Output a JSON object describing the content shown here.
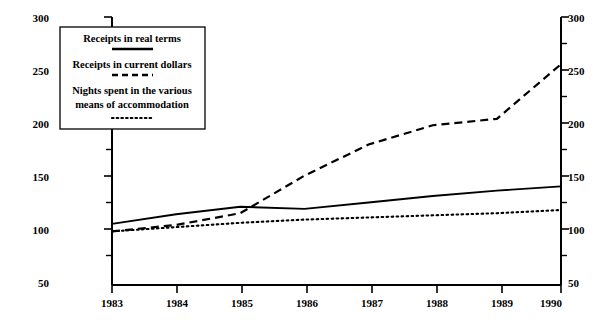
{
  "chart_data": {
    "type": "line",
    "title": "",
    "subtitle": "",
    "xlabel": "",
    "ylabel": "",
    "x": [
      1983,
      1984,
      1985,
      1986,
      1987,
      1988,
      1989,
      1990
    ],
    "xtick_labels": [
      "1983",
      "1984",
      "1985",
      "1986",
      "1987",
      "1988",
      "1989",
      "1990"
    ],
    "ytick_labels": [
      "50",
      "100",
      "150",
      "200",
      "250",
      "300"
    ],
    "ytick_values": [
      50,
      100,
      150,
      200,
      250,
      300
    ],
    "yminor_values": [
      75,
      125,
      175,
      225,
      275
    ],
    "ylim": [
      50,
      300
    ],
    "xlim": [
      1983,
      1990
    ],
    "grid": false,
    "legend_position": "top-left",
    "right_axis_mirrors_left": true,
    "series": [
      {
        "name": "Receipts in real terms",
        "style": "solid",
        "values": [
          107,
          116,
          123,
          121,
          127,
          133,
          138,
          142
        ]
      },
      {
        "name": "Receipts in current dollars",
        "style": "dashed",
        "values": [
          100,
          106,
          117,
          152,
          181,
          199,
          205,
          256
        ]
      },
      {
        "name": "Nights spent in the various means of accommodation",
        "style": "dotted",
        "values": [
          100,
          104,
          108,
          111,
          113,
          115,
          117,
          120
        ]
      }
    ]
  },
  "legend": {
    "entries": [
      {
        "label": "Receipts in real terms",
        "label_line2": "",
        "style": "solid"
      },
      {
        "label": "Receipts in current dollars",
        "label_line2": "",
        "style": "dashed"
      },
      {
        "label": "Nights spent in the various",
        "label_line2": "means of accommodation",
        "style": "dotted"
      }
    ]
  },
  "axes": {
    "left_ticks": [
      "300",
      "250",
      "200",
      "150",
      "100",
      "50"
    ],
    "right_ticks": [
      "300",
      "250",
      "200",
      "150",
      "100",
      "50"
    ],
    "bottom_ticks": [
      "1983",
      "1984",
      "1985",
      "1986",
      "1987",
      "1988",
      "1989",
      "1990"
    ]
  },
  "colors": {
    "ink": "#000000",
    "background": "#ffffff"
  }
}
